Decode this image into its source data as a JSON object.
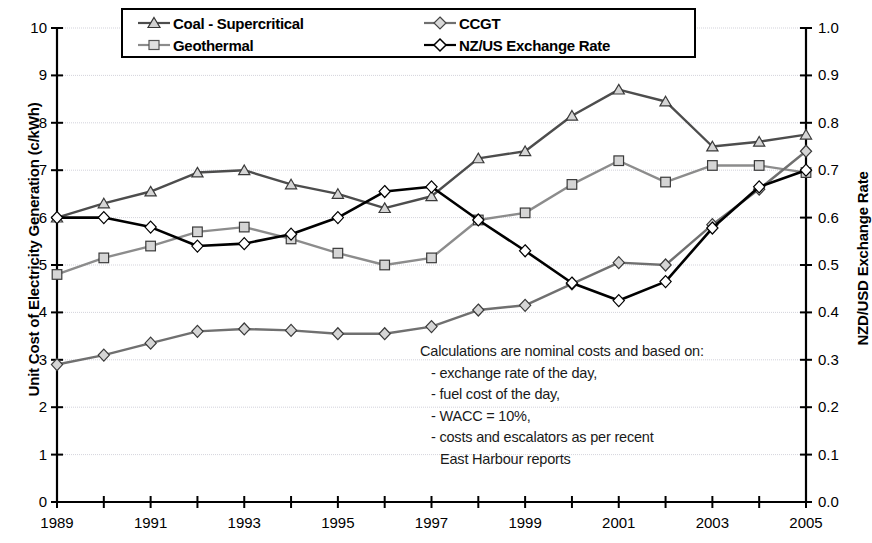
{
  "chart_data": {
    "type": "line",
    "title": "",
    "xlabel": "",
    "ylabel": "Unit Cost of Electricity Generation (c/kWh)",
    "y2label": "NZD/USD Exchange Rate",
    "ylim": [
      0,
      10
    ],
    "y2lim": [
      0.0,
      1.0
    ],
    "xlim": [
      1989,
      2005
    ],
    "grid": true,
    "legend_position": "top-center",
    "x": [
      1989,
      1990,
      1991,
      1992,
      1993,
      1994,
      1995,
      1996,
      1997,
      1998,
      1999,
      2000,
      2001,
      2002,
      2003,
      2004,
      2005
    ],
    "xtick_labels": [
      "1989",
      "1991",
      "1993",
      "1995",
      "1997",
      "1999",
      "2001",
      "2003",
      "2005"
    ],
    "ytick_labels": [
      "0",
      "1",
      "2",
      "3",
      "4",
      "5",
      "6",
      "7",
      "8",
      "9",
      "10"
    ],
    "y2tick_labels": [
      "0.0",
      "0.1",
      "0.2",
      "0.3",
      "0.4",
      "0.5",
      "0.6",
      "0.7",
      "0.8",
      "0.9",
      "1.0"
    ],
    "series": [
      {
        "name": "Coal - Supercritical",
        "axis": "left",
        "marker": "triangle",
        "color": "#4d4d4d",
        "values": [
          6.0,
          6.3,
          6.55,
          6.95,
          7.0,
          6.7,
          6.5,
          6.2,
          6.45,
          7.25,
          7.4,
          8.15,
          8.7,
          8.45,
          7.5,
          7.6,
          7.75
        ]
      },
      {
        "name": "Geothermal",
        "axis": "left",
        "marker": "square",
        "color": "#8c8c8c",
        "values": [
          4.8,
          5.15,
          5.4,
          5.7,
          5.8,
          5.55,
          5.25,
          5.0,
          5.15,
          5.95,
          6.1,
          6.7,
          7.2,
          6.75,
          7.1,
          7.1,
          6.95
        ]
      },
      {
        "name": "CCGT",
        "axis": "left",
        "marker": "diamond",
        "color": "#707070",
        "values": [
          2.9,
          3.1,
          3.35,
          3.6,
          3.65,
          3.62,
          3.55,
          3.55,
          3.7,
          4.05,
          4.15,
          4.6,
          5.05,
          5.0,
          5.85,
          6.6,
          7.4
        ]
      },
      {
        "name": "NZ/US Exchange Rate",
        "axis": "right",
        "marker": "diamond",
        "color": "#000000",
        "values": [
          0.6,
          0.6,
          0.58,
          0.54,
          0.545,
          0.565,
          0.6,
          0.655,
          0.665,
          0.595,
          0.53,
          0.462,
          0.425,
          0.465,
          0.578,
          0.665,
          0.7
        ]
      }
    ],
    "annotations": [
      "Calculations are nominal costs and based on:",
      "- exchange rate of the day,",
      "- fuel cost of the day,",
      "- WACC = 10%,",
      "- costs and escalators as per recent",
      "East Harbour reports"
    ]
  },
  "legend": {
    "items": [
      {
        "label": "Coal - Supercritical",
        "marker": "triangle-marker-icon"
      },
      {
        "label": "CCGT",
        "marker": "diamond-marker-icon"
      },
      {
        "label": "Geothermal",
        "marker": "square-marker-icon"
      },
      {
        "label": "NZ/US Exchange Rate",
        "marker": "diamond-marker-icon"
      }
    ]
  }
}
